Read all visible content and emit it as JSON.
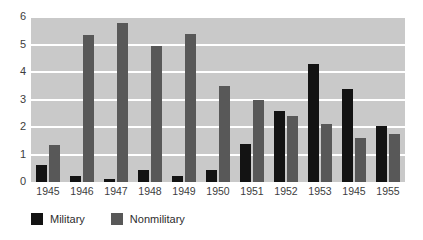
{
  "chart_data": {
    "type": "bar",
    "title": "",
    "subtitle": "",
    "xlabel": "",
    "ylabel": "",
    "categories": [
      "1945",
      "1946",
      "1947",
      "1948",
      "1949",
      "1950",
      "1951",
      "1952",
      "1953",
      "1945",
      "1955"
    ],
    "series": [
      {
        "name": "Military",
        "color": "#131313",
        "values": [
          0.62,
          0.22,
          0.12,
          0.42,
          0.22,
          0.42,
          1.4,
          2.6,
          4.3,
          3.4,
          2.05
        ]
      },
      {
        "name": "Nonmilitary",
        "color": "#585858",
        "values": [
          1.35,
          5.35,
          5.8,
          4.95,
          5.4,
          3.5,
          3.0,
          2.4,
          2.1,
          1.6,
          1.75
        ]
      }
    ],
    "ylim": [
      0,
      6
    ],
    "yticks": [
      "0",
      "1",
      "2",
      "3",
      "4",
      "5",
      "6"
    ],
    "grid": "horizontal-white-gridlines",
    "legend_position": "bottom-left",
    "plot_background": "#c9c9c9",
    "page_background": "#ffffff"
  },
  "legend": {
    "items": [
      {
        "label": "Military",
        "color": "#131313"
      },
      {
        "label": "Nonmilitary",
        "color": "#585858"
      }
    ]
  }
}
